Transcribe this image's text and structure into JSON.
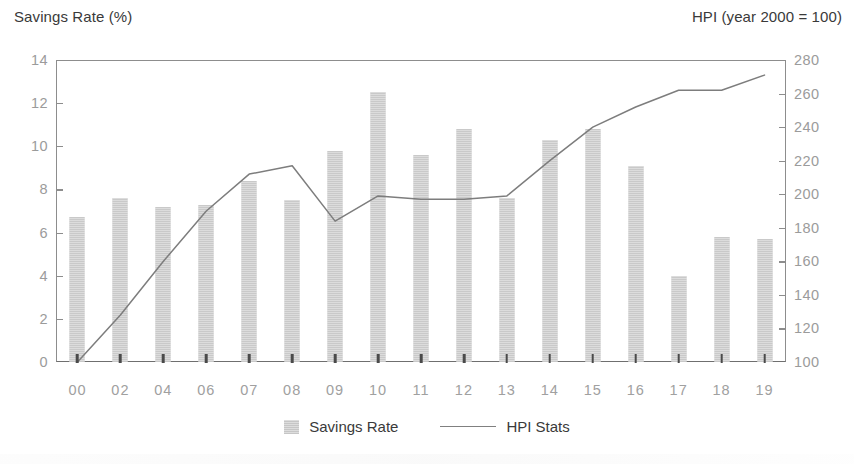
{
  "chart_data": {
    "type": "bar",
    "title": "",
    "subtitle": "",
    "xlabel": "",
    "ylabel": "Savings Rate (%)",
    "y2label": "HPI (year 2000 = 100)",
    "categories": [
      "00",
      "02",
      "04",
      "06",
      "07",
      "08",
      "09",
      "10",
      "11",
      "12",
      "13",
      "14",
      "15",
      "16",
      "17",
      "18",
      "19"
    ],
    "ylim": [
      0,
      14
    ],
    "y2lim": [
      100,
      280
    ],
    "yticks": [
      "0",
      "2",
      "4",
      "6",
      "8",
      "10",
      "12",
      "14"
    ],
    "y2ticks": [
      "100",
      "120",
      "140",
      "160",
      "180",
      "200",
      "220",
      "240",
      "260",
      "280"
    ],
    "grid": false,
    "legend_position": "bottom-center",
    "series": [
      {
        "name": "Savings Rate",
        "type": "bar",
        "axis": "left",
        "color": "#d2d2d2",
        "values": [
          6.7,
          7.6,
          7.2,
          7.3,
          8.4,
          7.5,
          9.8,
          12.5,
          9.6,
          10.8,
          7.6,
          10.3,
          10.8,
          9.1,
          4.0,
          5.8,
          5.7
        ]
      },
      {
        "name": "HPI Stats",
        "type": "line",
        "axis": "right",
        "color": "#7d7d7d",
        "values": [
          100,
          128,
          160,
          190,
          212,
          217,
          184,
          199,
          197,
          197,
          199,
          220,
          240,
          252,
          262,
          262,
          271
        ]
      }
    ]
  },
  "axis_titles": {
    "left": "Savings Rate (%)",
    "right": "HPI (year 2000 = 100)"
  },
  "legend": {
    "items": [
      {
        "label": "Savings Rate",
        "marker": "bar-swatch-icon"
      },
      {
        "label": "HPI Stats",
        "marker": "line-swatch-icon"
      }
    ]
  }
}
